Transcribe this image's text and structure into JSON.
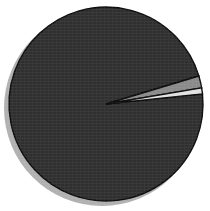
{
  "figure": {
    "background_color": "#ffffff",
    "width": 210,
    "height": 211
  },
  "pie": {
    "center_x": 106,
    "center_y": 104,
    "radius": 97,
    "start_angle_deg": 6,
    "edge_color": "#0d0d0d",
    "edge_width": 1.4,
    "shadow_color": "#b0b0b0",
    "shadow_offset_x": -4,
    "shadow_offset_y": 4
  },
  "chart_data": {
    "type": "pie",
    "title": "",
    "categories": [
      "Slice A",
      "Slice B",
      "Slice C"
    ],
    "values": [
      97.0,
      2.0,
      1.0
    ],
    "colors": [
      "#2f2f2f",
      "#8a8a8a",
      "#e2e2e2"
    ],
    "labels_shown": false,
    "legend": false,
    "legend_position": "none",
    "startangle": 6,
    "counterclock": false,
    "total": 100.0,
    "units": "percent"
  }
}
